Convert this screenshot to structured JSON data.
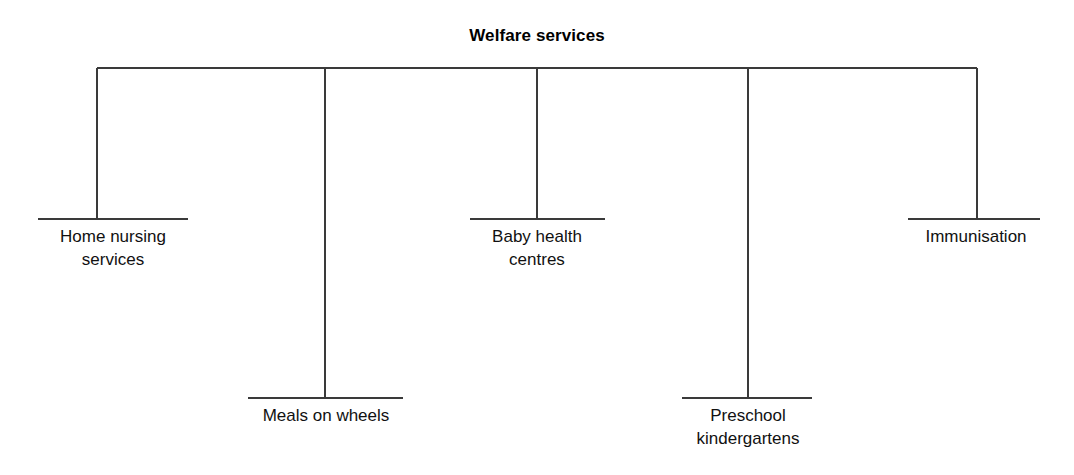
{
  "diagram": {
    "title": "Welfare services",
    "type": "tree-diagram",
    "orientation": "top-spine-with-drops",
    "line_color": "#3a3a3a",
    "text_color": "#111111",
    "background_color": "#ffffff",
    "spine": {
      "y": 68,
      "x_start": 97,
      "x_end": 977
    },
    "nodes": [
      {
        "id": "home-nursing-services",
        "label": "Home nursing\nservices",
        "line1": "Home nursing",
        "line2": "services",
        "stem_x": 97,
        "rule_y": 219,
        "rule_x_start": 38,
        "rule_x_end": 188,
        "label_x": 113,
        "label_y": 226
      },
      {
        "id": "meals-on-wheels",
        "label": "Meals on wheels",
        "line1": "Meals on wheels",
        "line2": "",
        "stem_x": 325,
        "rule_y": 398,
        "rule_x_start": 248,
        "rule_x_end": 403,
        "label_x": 326,
        "label_y": 405
      },
      {
        "id": "baby-health-centres",
        "label": "Baby health\ncentres",
        "line1": "Baby health",
        "line2": "centres",
        "stem_x": 537,
        "rule_y": 219,
        "rule_x_start": 470,
        "rule_x_end": 605,
        "label_x": 537,
        "label_y": 226
      },
      {
        "id": "preschool-kindergartens",
        "label": "Preschool\nkindergartens",
        "line1": "Preschool",
        "line2": "kindergartens",
        "stem_x": 748,
        "rule_y": 398,
        "rule_x_start": 682,
        "rule_x_end": 812,
        "label_x": 748,
        "label_y": 405
      },
      {
        "id": "immunisation",
        "label": "Immunisation",
        "line1": "Immunisation",
        "line2": "",
        "stem_x": 977,
        "rule_y": 219,
        "rule_x_start": 908,
        "rule_x_end": 1040,
        "label_x": 976,
        "label_y": 226
      }
    ]
  }
}
